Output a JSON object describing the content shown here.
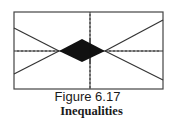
{
  "figure": {
    "label": "Figure 6.17",
    "title": "Inequalities"
  },
  "graph": {
    "frame": {
      "x": 14,
      "y": 12,
      "width": 149,
      "height": 77
    },
    "axes": {
      "x_axis_y": 51,
      "y_axis_x": 90,
      "tick_spacing": 4
    },
    "colors": {
      "line": "#333333",
      "fill": "#111111",
      "frame": "#444444",
      "background": "#ffffff"
    },
    "lines": [
      {
        "name": "upper-left-line",
        "from": [
          14,
          28
        ],
        "to": [
          59,
          51
        ]
      },
      {
        "name": "lower-left-line",
        "from": [
          14,
          74
        ],
        "to": [
          59,
          51
        ]
      },
      {
        "name": "upper-right-line",
        "from": [
          105,
          51
        ],
        "to": [
          163,
          20
        ]
      },
      {
        "name": "lower-right-line",
        "from": [
          105,
          51
        ],
        "to": [
          163,
          80
        ]
      }
    ],
    "shaded_region": {
      "name": "solution-region-diamond",
      "points": [
        [
          59,
          51
        ],
        [
          82,
          39
        ],
        [
          105,
          51
        ],
        [
          82,
          62
        ]
      ]
    }
  }
}
